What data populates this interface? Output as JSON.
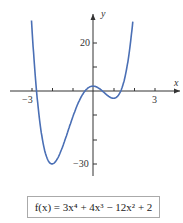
{
  "chart_data": {
    "type": "line",
    "title": "",
    "function": "f(x) = 3x^4 + 4x^3 - 12x^2 + 2",
    "xlabel": "x",
    "ylabel": "y",
    "x_ticks": [
      -3,
      -2,
      -1,
      0,
      1,
      2,
      3
    ],
    "x_tick_labels": [
      "-3",
      "3"
    ],
    "y_tick_labels": [
      "20",
      "-30"
    ],
    "y_ticks": [
      20,
      10,
      -10,
      -20,
      -30
    ],
    "xlim": [
      -3.5,
      4
    ],
    "ylim": [
      -35,
      30
    ],
    "key_points": [
      {
        "x": -2,
        "y": -30,
        "label": "local min"
      },
      {
        "x": 0,
        "y": 2,
        "label": "local max"
      },
      {
        "x": 1,
        "y": -3,
        "label": "local min"
      }
    ],
    "grid": false
  },
  "labels": {
    "x_axis": "x",
    "y_axis": "y",
    "tick_neg3": "−3",
    "tick_3": "3",
    "tick_20": "20",
    "tick_neg30": "−30"
  },
  "formula": {
    "text": "f(x) = 3x⁴ + 4x³ − 12x² + 2"
  },
  "colors": {
    "curve": "#4a6fb5",
    "axis": "#333333"
  }
}
